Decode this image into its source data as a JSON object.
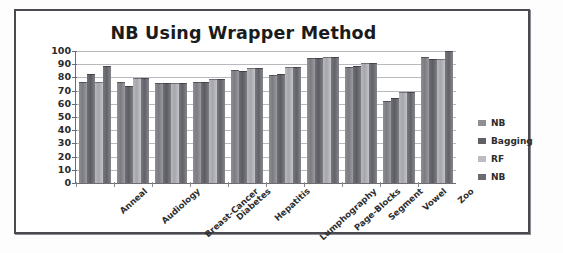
{
  "figure": {
    "border_color": "#4a4a50",
    "background": "#ffffff"
  },
  "legend": {
    "position": "right",
    "items": [
      {
        "label": "NB",
        "color": "#8e8e94",
        "swatch_name": "legend-swatch-nb-1"
      },
      {
        "label": "Bagging",
        "color": "#5f5f66",
        "swatch_name": "legend-swatch-bagging"
      },
      {
        "label": "RF",
        "color": "#bcbcc2",
        "swatch_name": "legend-swatch-rf"
      },
      {
        "label": "NB",
        "color": "#6a6a71",
        "swatch_name": "legend-swatch-nb-2"
      }
    ]
  },
  "chart_data": {
    "type": "bar",
    "title": "NB Using Wrapper Method",
    "xlabel": "",
    "ylabel": "",
    "ylim": [
      0,
      100
    ],
    "ytick_step": 10,
    "yticks": [
      100,
      90,
      80,
      70,
      60,
      50,
      40,
      30,
      20,
      10,
      0
    ],
    "grid": true,
    "legend_position": "right",
    "categories": [
      "Anneal",
      "Audiology",
      "Breast-Cancer",
      "Diabetes",
      "Hepatitis",
      "Lumphography",
      "Page-Blocks",
      "Segment",
      "Vowel",
      "Zoo"
    ],
    "series": [
      {
        "name": "NB",
        "color": "#8e8e94",
        "values": [
          76,
          76,
          75,
          76,
          85,
          81,
          94,
          87,
          61,
          95
        ]
      },
      {
        "name": "Bagging",
        "color": "#5f5f66",
        "values": [
          82,
          73,
          75,
          76,
          84,
          82,
          94,
          88,
          64,
          93
        ]
      },
      {
        "name": "RF",
        "color": "#bcbcc2",
        "values": [
          76,
          79,
          75,
          78,
          86,
          87,
          95,
          90,
          68,
          93
        ]
      },
      {
        "name": "NB",
        "color": "#6a6a71",
        "values": [
          88,
          79,
          75,
          78,
          86,
          87,
          95,
          90,
          68,
          99
        ]
      }
    ]
  }
}
